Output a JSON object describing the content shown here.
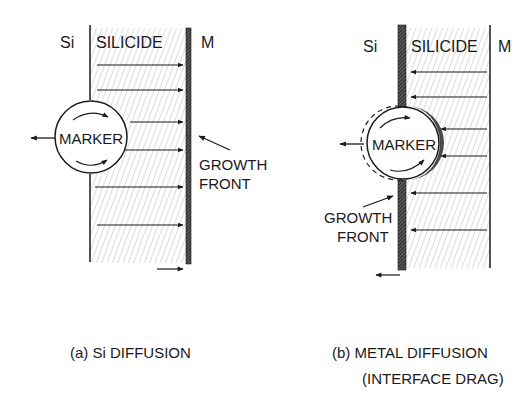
{
  "panel_a": {
    "left_label": "Si",
    "layer_label": "SILICIDE",
    "right_label": "M",
    "marker_label": "MARKER",
    "growth_front_line1": "GROWTH",
    "growth_front_line2": "FRONT",
    "caption": "(a) Si DIFFUSION",
    "flux_direction": "right",
    "arrow_rows": [
      65,
      90,
      122,
      150,
      187,
      225
    ]
  },
  "panel_b": {
    "left_label": "Si",
    "layer_label": "SILICIDE",
    "right_label": "M",
    "marker_label": "MARKER",
    "growth_front_line1": "GROWTH",
    "growth_front_line2": "FRONT",
    "caption_line1": "(b) METAL DIFFUSION",
    "caption_line2": "(INTERFACE DRAG)",
    "flux_direction": "left",
    "arrow_rows": [
      72,
      97,
      129,
      156,
      193,
      230
    ]
  },
  "colors": {
    "ink": "#1a1a1a",
    "hatch": "#9a9a9a",
    "background": "#ffffff"
  }
}
